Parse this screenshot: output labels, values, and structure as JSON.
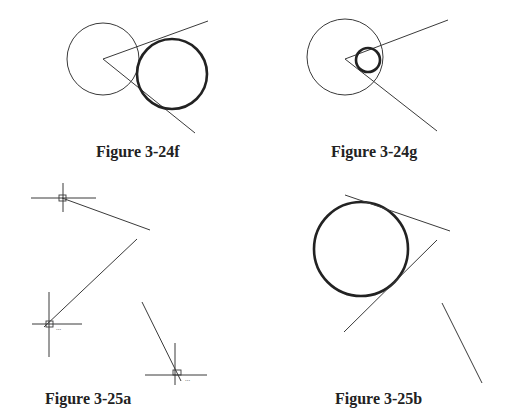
{
  "figures": [
    {
      "id": "3-24f",
      "caption": "Figure 3-24f"
    },
    {
      "id": "3-24g",
      "caption": "Figure 3-24g"
    },
    {
      "id": "3-25a",
      "caption": "Figure 3-25a"
    },
    {
      "id": "3-25b",
      "caption": "Figure 3-25b"
    }
  ],
  "colors": {
    "line": "#3a3a3a",
    "text": "#222222",
    "background": "#ffffff"
  }
}
